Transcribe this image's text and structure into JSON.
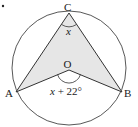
{
  "diagram": {
    "type": "circle-geometry",
    "circle": {
      "cx": 69,
      "cy": 68,
      "r": 57,
      "stroke": "#444444"
    },
    "shade_color": "#e6e6e6",
    "line_color": "#333333",
    "points": {
      "C": {
        "label": "C",
        "x": 69,
        "y": 13
      },
      "O": {
        "label": "O",
        "x": 69,
        "y": 70
      },
      "A": {
        "label": "A",
        "x": 16,
        "y": 92
      },
      "B": {
        "label": "B",
        "x": 122,
        "y": 92
      }
    },
    "angles": {
      "at_C": {
        "label": "x"
      },
      "at_O": {
        "label": "x + 22°"
      }
    },
    "bullet": "•"
  }
}
